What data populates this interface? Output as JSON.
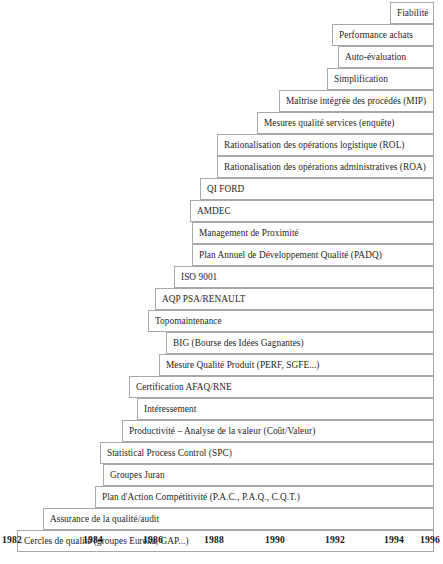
{
  "figure": {
    "type": "staircase-timeline",
    "background_color": "#ffffff",
    "border_color": "#a9a9a9",
    "text_color": "#1f1f1f"
  },
  "axis": {
    "name": "year-axis",
    "ticks": [
      "1982",
      "1984",
      "1986",
      "1988",
      "1990",
      "1992",
      "1994",
      "1996"
    ],
    "tick_x": [
      2,
      83,
      143,
      204,
      265,
      325,
      384,
      420
    ],
    "range_start": 1982,
    "range_end": 1996
  },
  "steps": [
    {
      "label": "Fiabilité",
      "left": 390,
      "top": 2
    },
    {
      "label": "Performance achats",
      "left": 332,
      "top": 24
    },
    {
      "label": "Auto-évaluation",
      "left": 338,
      "top": 46
    },
    {
      "label": "Simplification",
      "left": 327,
      "top": 68
    },
    {
      "label": "Maîtrise intégrée des procédés (MIP)",
      "left": 279,
      "top": 90
    },
    {
      "label": "Mesures qualité services (enquête)",
      "left": 257,
      "top": 112
    },
    {
      "label": "Rationalisation des opérations logistique (ROL)",
      "left": 217,
      "top": 134
    },
    {
      "label": "Rationalisation des opérations administratives (ROA)",
      "left": 217,
      "top": 156
    },
    {
      "label": "QI FORD",
      "left": 200,
      "top": 178
    },
    {
      "label": "AMDEC",
      "left": 190,
      "top": 200
    },
    {
      "label": "Management de Proximité",
      "left": 192,
      "top": 222
    },
    {
      "label": "Plan Annuel de Développement Qualité (PADQ)",
      "left": 192,
      "top": 244
    },
    {
      "label": "ISO 9001",
      "left": 174,
      "top": 266
    },
    {
      "label": "AQP PSA/RENAULT",
      "left": 155,
      "top": 288
    },
    {
      "label": "Topomaintenance",
      "left": 148,
      "top": 310
    },
    {
      "label": "BIG (Bourse des Idées Gagnantes)",
      "left": 166,
      "top": 332
    },
    {
      "label": "Mesure Qualité Produit (PERF, SGFE...)",
      "left": 159,
      "top": 354
    },
    {
      "label": "Certification AFAQ/RNE",
      "left": 129,
      "top": 376
    },
    {
      "label": "Intéressement",
      "left": 137,
      "top": 398
    },
    {
      "label": "Productivité – Analyse de la valeur (Coût/Valeur)",
      "left": 122,
      "top": 420
    },
    {
      "label": "Statistical Process Control (SPC)",
      "left": 100,
      "top": 442
    },
    {
      "label": "Groupes Juran",
      "left": 103,
      "top": 464
    },
    {
      "label": "Plan d'Action Compétitivité (P.A.C., P.A.Q., C.Q.T.)",
      "left": 95,
      "top": 486
    },
    {
      "label": "Assurance de la qualité/audit",
      "left": 43,
      "top": 508
    },
    {
      "label": "Cercles de qualité (groupes Euréka, GAP...)",
      "left": 17,
      "top": 530
    }
  ],
  "layout": {
    "right_edge": 434,
    "row_height": 22
  }
}
